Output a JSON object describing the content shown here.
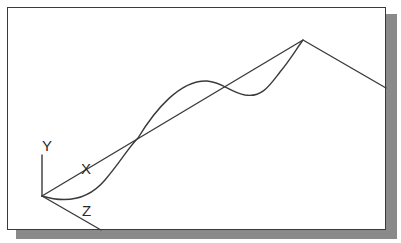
{
  "diagram": {
    "axes_labels": {
      "y": "Y",
      "x": "X",
      "z": "Z"
    },
    "colors": {
      "line": "#3a3a3a",
      "shadow": "#8a8a8a",
      "background": "#ffffff"
    },
    "elements": [
      "polyline from origin to apex to right edge",
      "spline curve from origin through intersection to apex",
      "UCS icon with X, Y, Z axis labels"
    ]
  }
}
